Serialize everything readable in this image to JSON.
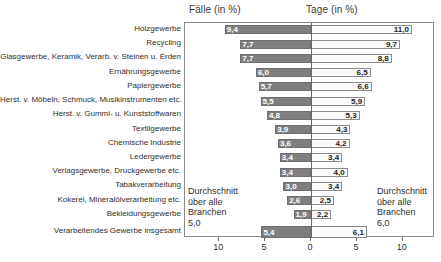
{
  "headers": {
    "left": "Fälle (in %)",
    "right": "Tage (in %)"
  },
  "annotations": {
    "left": {
      "line1": "Durchschnitt",
      "line2": "über alle",
      "line3": "Branchen",
      "value": "5,0"
    },
    "right": {
      "line1": "Durchschnitt",
      "line2": "über alle",
      "line3": "Branchen",
      "value": "6,0"
    }
  },
  "axis": {
    "ticks": [
      {
        "label": "10",
        "pos": 10,
        "side": "left"
      },
      {
        "label": "5",
        "pos": 5,
        "side": "left"
      },
      {
        "label": "0",
        "pos": 0,
        "side": "center"
      },
      {
        "label": "5",
        "pos": 5,
        "side": "right"
      },
      {
        "label": "10",
        "pos": 10,
        "side": "right"
      }
    ]
  },
  "chart_data": {
    "type": "bar",
    "orientation": "horizontal",
    "layout": "diverging-two-panel",
    "title": "",
    "xlabel": "",
    "ylabel": "",
    "xlim": [
      13.7,
      13.7
    ],
    "grid": false,
    "legend": null,
    "categories": [
      "Holzgewerbe",
      "Recycling",
      "Glasgewerbe, Keramik, Verarb. v. Steinen u. Erden",
      "Ernährungsgewerbe",
      "Papiergewerbe",
      "Herst. v. Möbeln, Schmuck, Musikinstrumenten etc.",
      "Herst. v. Gummi- u. Kunststoffwaren",
      "Textilgewerbe",
      "Chemische Industrie",
      "Ledergewerbe",
      "Verlagsgewerbe, Druckgewerbe etc.",
      "Tabakverarbeitung",
      "Kokerei, Mineralölverarbeitung etc.",
      "Bekleidungsgewerbe",
      "Verarbeitendes Gewerbe insgesamt"
    ],
    "series": [
      {
        "name": "Fälle (in %)",
        "side": "left",
        "values": [
          9.4,
          7.7,
          7.7,
          6.0,
          5.7,
          5.5,
          4.8,
          3.9,
          3.6,
          3.4,
          3.4,
          3.0,
          2.6,
          1.9,
          5.4
        ],
        "labels": [
          "9,4",
          "7,7",
          "7,7",
          "6,0",
          "5,7",
          "5,5",
          "4,8",
          "3,9",
          "3,6",
          "3,4",
          "3,4",
          "3,0",
          "2,6",
          "1,9",
          "5,4"
        ],
        "average": 5.0
      },
      {
        "name": "Tage (in %)",
        "side": "right",
        "values": [
          11.0,
          9.7,
          8.8,
          6.5,
          6.6,
          5.9,
          5.3,
          4.3,
          4.2,
          3.4,
          4.0,
          3.4,
          2.5,
          2.2,
          6.1
        ],
        "labels": [
          "11,0",
          "9,7",
          "8,8",
          "6,5",
          "6,6",
          "5,9",
          "5,3",
          "4,3",
          "4,2",
          "3,4",
          "4,0",
          "3,4",
          "2,5",
          "2,2",
          "6,1"
        ],
        "average": 6.0
      }
    ]
  }
}
